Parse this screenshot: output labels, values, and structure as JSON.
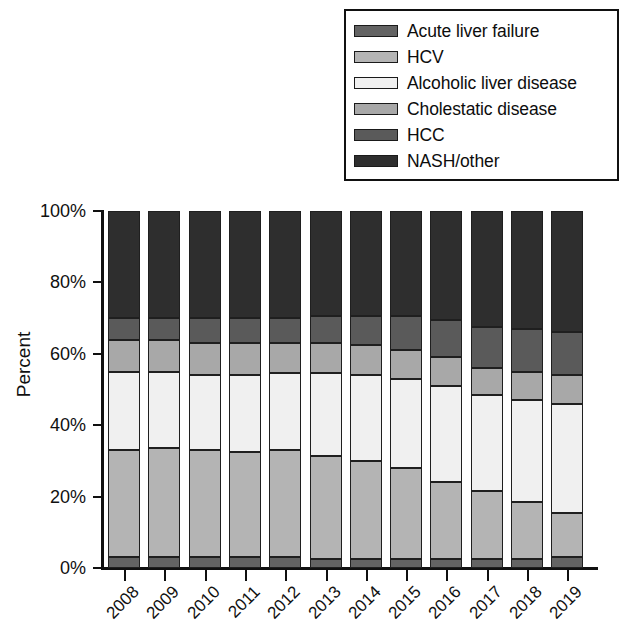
{
  "chart_data": {
    "type": "bar",
    "subtype": "stacked-100-percent",
    "title": "",
    "xlabel": "",
    "ylabel": "Percent",
    "ylim": [
      0,
      100
    ],
    "ytick_labels": [
      "0%",
      "20%",
      "40%",
      "60%",
      "80%",
      "100%"
    ],
    "ytick_values": [
      0,
      20,
      40,
      60,
      80,
      100
    ],
    "grid": false,
    "legend_position": "top-right",
    "categories": [
      "2008",
      "2009",
      "2010",
      "2011",
      "2012",
      "2013",
      "2014",
      "2015",
      "2016",
      "2017",
      "2018",
      "2019"
    ],
    "series": [
      {
        "name": "Acute liver failure",
        "color": "#636363",
        "values": [
          3,
          3,
          3,
          3,
          3,
          2.5,
          2.5,
          2.5,
          2.5,
          2.5,
          2.5,
          3
        ]
      },
      {
        "name": "HCV",
        "color": "#b4b4b4",
        "values": [
          30,
          30.5,
          30,
          29.5,
          30,
          29,
          27.5,
          25.5,
          21.5,
          19,
          16,
          12.5
        ]
      },
      {
        "name": "Alcoholic liver disease",
        "color": "#f0f0f0",
        "values": [
          22,
          21.5,
          21,
          21.5,
          21.5,
          23,
          24,
          25,
          27,
          27,
          28.5,
          30.5
        ]
      },
      {
        "name": "Cholestatic disease",
        "color": "#a8a8a8",
        "values": [
          9,
          9,
          9,
          9,
          8.5,
          8.5,
          8.5,
          8,
          8,
          7.5,
          8,
          8
        ]
      },
      {
        "name": "HCC",
        "color": "#5a5a5a",
        "values": [
          6,
          6,
          7,
          7,
          7,
          7.5,
          8,
          9.5,
          10.5,
          11.5,
          12,
          12
        ]
      },
      {
        "name": "NASH/other",
        "color": "#2e2e2e",
        "values": [
          30,
          30,
          30,
          30,
          30,
          29.5,
          29.5,
          29.5,
          30.5,
          32.5,
          33,
          34
        ]
      }
    ]
  },
  "legend": {
    "items": [
      {
        "label": "Acute liver failure",
        "color": "#636363"
      },
      {
        "label": "HCV",
        "color": "#b4b4b4"
      },
      {
        "label": "Alcoholic liver disease",
        "color": "#f0f0f0"
      },
      {
        "label": "Cholestatic disease",
        "color": "#a8a8a8"
      },
      {
        "label": "HCC",
        "color": "#5a5a5a"
      },
      {
        "label": "NASH/other",
        "color": "#2e2e2e"
      }
    ]
  }
}
